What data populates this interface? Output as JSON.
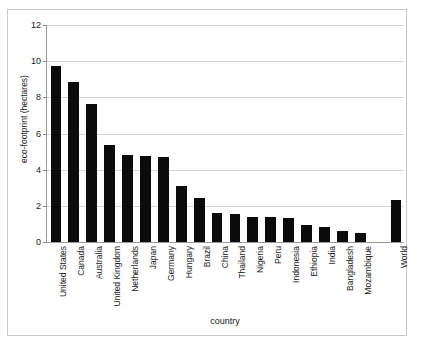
{
  "chart_data": {
    "type": "bar",
    "title": "",
    "xlabel": "country",
    "ylabel": "eco-footprint (hectares)",
    "ylim": [
      0,
      12
    ],
    "ytick_labels": [
      "0",
      "2",
      "4",
      "6",
      "8",
      "10",
      "12"
    ],
    "ytick_values": [
      0,
      2,
      4,
      6,
      8,
      10,
      12
    ],
    "grid": true,
    "legend": false,
    "bar_color": "#0b0b0b",
    "categories": [
      "United States",
      "Canada",
      "Australia",
      "United Kingdom",
      "Netherlands",
      "Japan",
      "Germany",
      "Hungary",
      "Brazil",
      "China",
      "Thailand",
      "Nigeria",
      "Peru",
      "Indonesia",
      "Ethiopia",
      "India",
      "Bangladesh",
      "Mozambique",
      "World"
    ],
    "values": [
      9.7,
      8.8,
      7.6,
      5.35,
      4.8,
      4.75,
      4.7,
      3.1,
      2.4,
      1.6,
      1.55,
      1.4,
      1.35,
      1.3,
      0.95,
      0.85,
      0.6,
      0.5,
      2.3
    ],
    "gap_before_last": true
  },
  "axis": {
    "y_title": "eco-footprint (hectares)",
    "x_title": "country"
  }
}
